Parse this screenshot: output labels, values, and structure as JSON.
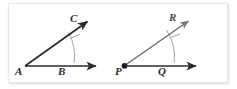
{
  "figure": {
    "background_color": "#ffffff",
    "card": {
      "fill": "#ffffff",
      "border_color": "#e9e9e9",
      "shadow_color": "rgba(0,0,0,0.13)"
    },
    "diagrams": [
      {
        "name": "angle-A",
        "vertex_label": "A",
        "vertex_has_dot": false,
        "base_ray_label": "B",
        "upper_ray_label": "C",
        "stroke_color": "#2b2b2b",
        "arc_color": "#8c8c8c",
        "vertex": {
          "x": 25,
          "y": 66
        },
        "base_ray_end": {
          "x": 99,
          "y": 66
        },
        "upper_ray_end": {
          "x": 90,
          "y": 19
        },
        "arc": {
          "radius": 50,
          "start_deg": 0,
          "end_deg": 33
        },
        "tick_at_label": "C",
        "labels": {
          "A": {
            "x": 17,
            "y": 70
          },
          "B": {
            "x": 59,
            "y": 70
          },
          "C": {
            "x": 70,
            "y": 17
          }
        }
      },
      {
        "name": "angle-P",
        "vertex_label": "P",
        "vertex_has_dot": true,
        "base_ray_label": "Q",
        "upper_ray_label": "R",
        "stroke_color": "#2b2b2b",
        "ray_color": "#6e6e6e",
        "arc_color": "#8c8c8c",
        "vertex": {
          "x": 124,
          "y": 66
        },
        "base_ray_end": {
          "x": 198,
          "y": 66
        },
        "upper_ray_end": {
          "x": 190,
          "y": 19
        },
        "arc": {
          "radius": 50,
          "start_deg": 0,
          "end_deg": 36
        },
        "tick_at_label": "R",
        "labels": {
          "P": {
            "x": 117,
            "y": 70
          },
          "Q": {
            "x": 159,
            "y": 70
          },
          "R": {
            "x": 170,
            "y": 16
          }
        }
      }
    ]
  }
}
